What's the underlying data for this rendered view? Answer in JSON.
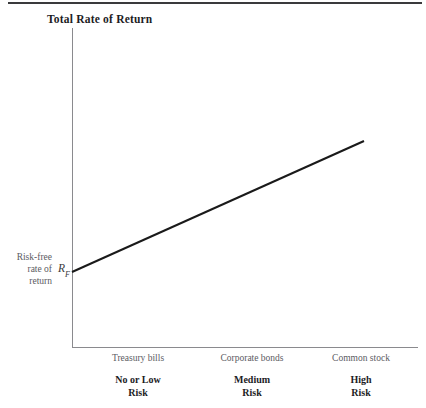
{
  "figure": {
    "title": "Total Rate of Return",
    "has_top_rule": true,
    "background_color": "#ffffff",
    "axis_color": "#8a8a8e",
    "line_color": "#1a1a1a",
    "text_color": "#5b5b5f",
    "bold_text_color": "#1d1d1f"
  },
  "y_axis": {
    "label_lines": [
      "Risk-free",
      "rate of",
      "return"
    ],
    "intercept_symbol": "R",
    "intercept_subscript": "F"
  },
  "x_axis": {
    "categories": [
      {
        "asset": "Treasury bills",
        "risk_line1": "No or Low",
        "risk_line2": "Risk"
      },
      {
        "asset": "Corporate bonds",
        "risk_line1": "Medium",
        "risk_line2": "Risk"
      },
      {
        "asset": "Common stock",
        "risk_line1": "High",
        "risk_line2": "Risk"
      }
    ]
  },
  "chart_data": {
    "type": "line",
    "title": "Total Rate of Return",
    "xlabel": "",
    "ylabel": "Total Rate of Return",
    "grid": false,
    "legend": "none",
    "categories": [
      "Treasury bills",
      "Corporate bonds",
      "Common stock"
    ],
    "category_risk_levels": [
      "No or Low Risk",
      "Medium Risk",
      "High Risk"
    ],
    "annotations": [
      {
        "text": "R_F",
        "meaning": "Risk-free rate of return",
        "at": "y-intercept"
      }
    ],
    "series": [
      {
        "name": "Total Rate of Return",
        "x": [
          "Treasury bills",
          "Corporate bonds",
          "Common stock"
        ],
        "values": [
          0,
          0.5,
          1.0
        ],
        "description": "Straight upward-sloping line from the risk-free rate R_F at the y-axis to a high return at the common-stock (high risk) end",
        "pixel_start": [
          72,
          272
        ],
        "pixel_end": [
          364,
          141
        ],
        "stroke_width_px": 2
      }
    ],
    "ylim_note": "unlabeled ordinal axis; y starts at risk-free rate R_F above the origin",
    "xlim_note": "unlabeled ordinal axis spanning no/low risk to high risk"
  }
}
